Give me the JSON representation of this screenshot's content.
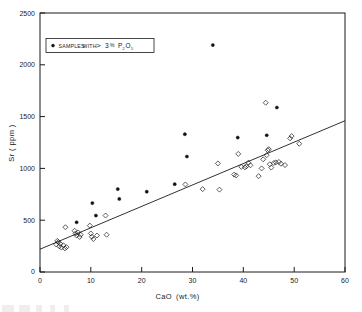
{
  "chart_data": {
    "type": "scatter",
    "title": "",
    "xlabel": "CaO (wt.%)",
    "ylabel": "Sr (ppm)",
    "xlim": [
      0,
      60
    ],
    "ylim": [
      0,
      2500
    ],
    "xticks": [
      0,
      10,
      20,
      30,
      40,
      50,
      60
    ],
    "yticks": [
      0,
      500,
      1000,
      1500,
      2000,
      2500
    ],
    "grid": false,
    "legend_position": "upper-left",
    "series": [
      {
        "name": "SAMPLES WITH > 3 % P2O5",
        "marker": "filled-circle",
        "points": [
          [
            7.2,
            480
          ],
          [
            10.3,
            665
          ],
          [
            11.0,
            545
          ],
          [
            15.3,
            800
          ],
          [
            15.6,
            705
          ],
          [
            21.0,
            775
          ],
          [
            26.5,
            848
          ],
          [
            28.5,
            1330
          ],
          [
            28.9,
            1115
          ],
          [
            34.0,
            2190
          ],
          [
            38.9,
            1298
          ],
          [
            44.6,
            1320
          ],
          [
            46.6,
            1588
          ]
        ]
      },
      {
        "name": "other samples",
        "marker": "open-diamond",
        "points": [
          [
            3.2,
            265
          ],
          [
            3.4,
            300
          ],
          [
            3.6,
            288
          ],
          [
            3.8,
            248
          ],
          [
            4.0,
            272
          ],
          [
            4.2,
            235
          ],
          [
            4.6,
            258
          ],
          [
            4.9,
            228
          ],
          [
            5.0,
            432
          ],
          [
            5.2,
            240
          ],
          [
            6.8,
            398
          ],
          [
            7.0,
            372
          ],
          [
            7.2,
            352
          ],
          [
            7.5,
            382
          ],
          [
            7.8,
            338
          ],
          [
            8.0,
            360
          ],
          [
            9.8,
            448
          ],
          [
            10.0,
            372
          ],
          [
            10.2,
            340
          ],
          [
            10.5,
            318
          ],
          [
            11.2,
            352
          ],
          [
            12.9,
            545
          ],
          [
            13.1,
            360
          ],
          [
            28.6,
            845
          ],
          [
            32.0,
            800
          ],
          [
            35.0,
            1048
          ],
          [
            35.3,
            795
          ],
          [
            38.2,
            940
          ],
          [
            38.6,
            932
          ],
          [
            39.0,
            1140
          ],
          [
            39.6,
            1015
          ],
          [
            40.3,
            1010
          ],
          [
            40.6,
            1020
          ],
          [
            41.0,
            1055
          ],
          [
            41.4,
            1030
          ],
          [
            43.0,
            925
          ],
          [
            43.6,
            1000
          ],
          [
            43.9,
            1088
          ],
          [
            44.4,
            1634
          ],
          [
            44.6,
            1128
          ],
          [
            44.8,
            1175
          ],
          [
            45.0,
            1185
          ],
          [
            45.2,
            1040
          ],
          [
            45.5,
            1008
          ],
          [
            46.0,
            1052
          ],
          [
            46.4,
            1058
          ],
          [
            47.0,
            1062
          ],
          [
            47.4,
            1045
          ],
          [
            48.2,
            1032
          ],
          [
            49.2,
            1290
          ],
          [
            49.5,
            1312
          ],
          [
            51.0,
            1238
          ]
        ]
      }
    ],
    "fit_line": {
      "label": "regression line",
      "x": [
        0,
        60
      ],
      "y": [
        220,
        1460
      ]
    }
  },
  "legend": {
    "marker": "filled-circle",
    "text_part1": "SAMPLES",
    "text_part2": "WITH",
    "symbol_ge": ">",
    "value": "3",
    "percent": "%",
    "compound_main": "P",
    "compound_sub1": "2",
    "compound_mid": "O",
    "compound_sub2": "5"
  },
  "axes": {
    "x_title_main": "CaO",
    "x_title_unit": "(wt.%)",
    "y_title": "Sr ( ppm )",
    "x_tick_labels": [
      "0",
      "10",
      "20",
      "30",
      "40",
      "50",
      "60"
    ],
    "y_tick_labels": [
      "0",
      "500",
      "1000",
      "1500",
      "2000",
      "2500"
    ]
  },
  "colors": {
    "ink": "#1a1a1a",
    "background": "#ffffff",
    "marker_filled": "#111111"
  }
}
